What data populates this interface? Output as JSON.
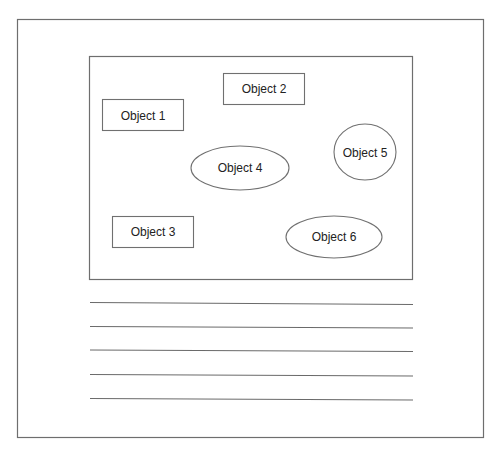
{
  "diagram": {
    "objects": [
      {
        "id": "object-1",
        "label": "Object 1",
        "shape": "rectangle"
      },
      {
        "id": "object-2",
        "label": "Object 2",
        "shape": "rectangle"
      },
      {
        "id": "object-3",
        "label": "Object 3",
        "shape": "rectangle"
      },
      {
        "id": "object-4",
        "label": "Object 4",
        "shape": "ellipse"
      },
      {
        "id": "object-5",
        "label": "Object 5",
        "shape": "ellipse"
      },
      {
        "id": "object-6",
        "label": "Object 6",
        "shape": "ellipse"
      }
    ],
    "text_lines_count": 5
  },
  "colors": {
    "stroke": "#6e6e6e",
    "text": "#222222",
    "background": "#ffffff"
  }
}
